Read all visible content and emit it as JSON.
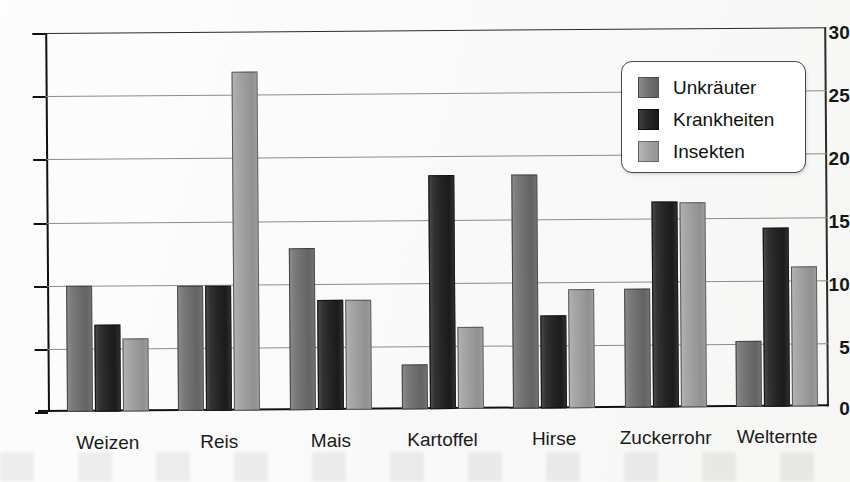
{
  "chart_data": {
    "type": "bar",
    "title": "",
    "subtitle": "",
    "xlabel": "",
    "ylabel": "",
    "ylim": [
      0,
      30
    ],
    "yticks": [
      0,
      5,
      10,
      15,
      20,
      25,
      30
    ],
    "ytick_labels": [
      "0",
      "5",
      "10",
      "15",
      "20",
      "25",
      "30"
    ],
    "grid": true,
    "legend_position": "top-right",
    "categories": [
      "Weizen",
      "Reis",
      "Mais",
      "Kartoffel",
      "Hirse",
      "Zuckerrohr",
      "Welternte"
    ],
    "series": [
      {
        "name": "Unkräuter",
        "color": "#6f6f6f",
        "values": [
          10.0,
          9.9,
          12.8,
          3.6,
          18.5,
          9.4,
          5.2
        ]
      },
      {
        "name": "Krankheiten",
        "color": "#242424",
        "values": [
          6.9,
          9.9,
          8.7,
          18.5,
          7.4,
          16.3,
          14.2
        ]
      },
      {
        "name": "Insekten",
        "color": "#9c9c9c",
        "values": [
          5.8,
          26.8,
          8.7,
          6.5,
          9.4,
          16.2,
          11.1
        ]
      }
    ]
  },
  "legend": {
    "items": [
      {
        "label": "Unkräuter",
        "color": "#6f6f6f"
      },
      {
        "label": "Krankheiten",
        "color": "#242424"
      },
      {
        "label": "Insekten",
        "color": "#9c9c9c"
      }
    ]
  },
  "axis": {
    "y_tick_labels": [
      "30",
      "25",
      "20",
      "15",
      "10",
      "5",
      "0"
    ],
    "x_tick_labels": [
      "Weizen",
      "Reis",
      "Mais",
      "Kartoffel",
      "Hirse",
      "Zuckerrohr",
      "Welternte"
    ]
  },
  "colors": {
    "series_unkraeuter": "#6f6f6f",
    "series_krankheiten": "#242424",
    "series_insekten": "#9c9c9c",
    "axis": "#111111",
    "gridline": "#8c8c8c",
    "background": "#fafafa"
  }
}
